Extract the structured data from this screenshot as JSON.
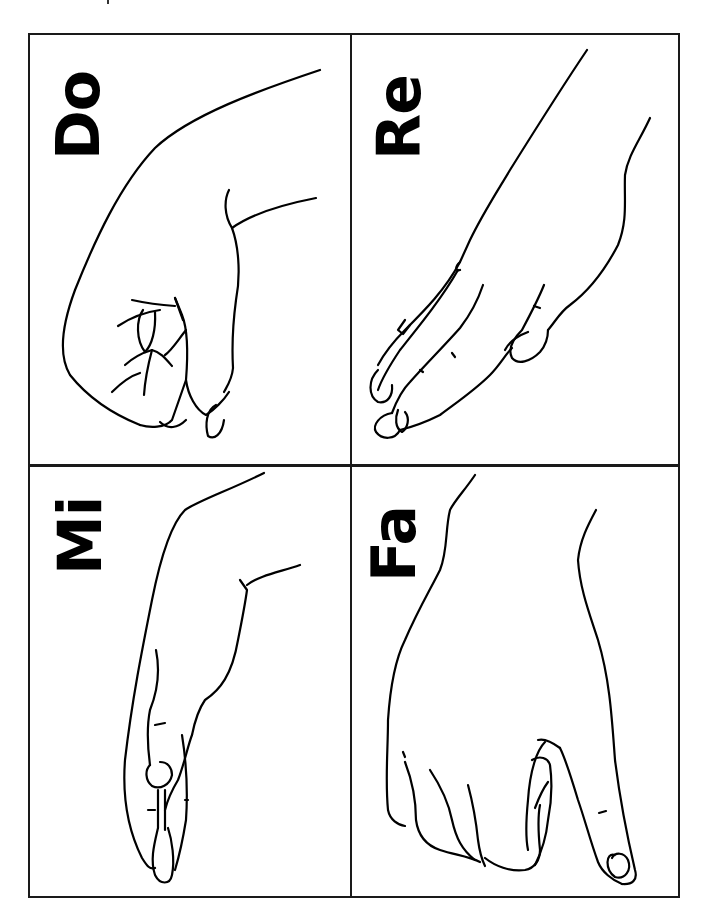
{
  "chart_title": "",
  "panels": [
    {
      "label": "Do",
      "description": "closed fist, thumb tucked over fingers, viewed from side"
    },
    {
      "label": "Re",
      "description": "hand angled downward with fingers extended together"
    },
    {
      "label": "Mi",
      "description": "flat hand held horizontally, palm down, fingers together"
    },
    {
      "label": "Fa",
      "description": "fist with thumb pointing down"
    }
  ]
}
